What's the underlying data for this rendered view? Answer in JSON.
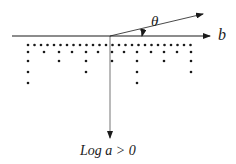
{
  "diagram": {
    "labels": {
      "theta": "θ",
      "b": "b",
      "log_a": "Log a > 0"
    },
    "colors": {
      "ink": "#1a1a1a",
      "background": "#ffffff"
    },
    "surface_line": {
      "x1": 12,
      "y1": 36,
      "x2": 210,
      "y2": 36
    },
    "theta_arrow": {
      "x1": 110,
      "y1": 36,
      "x2": 203,
      "y2": 14
    },
    "normal_arrow": {
      "x1": 110,
      "y1": 36,
      "x2": 110,
      "y2": 138
    },
    "dot_rows": [
      {
        "y": 45,
        "x": [
          28,
          34.5,
          41,
          47.5,
          54,
          60.5,
          67,
          73.5,
          80,
          86.5,
          93,
          99.5,
          106,
          112.5,
          119,
          125.5,
          132,
          138.5,
          145,
          151.5,
          158,
          164.5,
          171,
          177.5,
          184,
          190.5
        ]
      },
      {
        "y": 52,
        "x": [
          28,
          44,
          59,
          72,
          86,
          98,
          112,
          124,
          137,
          151,
          164,
          177,
          191
        ]
      },
      {
        "y": 61,
        "x": [
          28,
          59,
          86,
          112,
          137,
          164,
          191
        ]
      },
      {
        "y": 72,
        "x": [
          28,
          86,
          137,
          191
        ]
      },
      {
        "y": 83,
        "x": [
          28,
          137
        ]
      }
    ]
  }
}
